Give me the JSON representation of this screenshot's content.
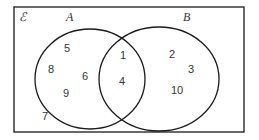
{
  "universal_label": "ℰ",
  "sets": [
    {
      "name": "A",
      "only": [
        "5",
        "8",
        "6",
        "9"
      ]
    },
    {
      "name": "B",
      "only": [
        "2",
        "3",
        "10"
      ]
    }
  ],
  "intersection": [
    "1",
    "4"
  ],
  "outside": [
    "7"
  ],
  "colors": {
    "stroke": "#1a1a1a",
    "text": "#333333",
    "background": "#ffffff"
  }
}
